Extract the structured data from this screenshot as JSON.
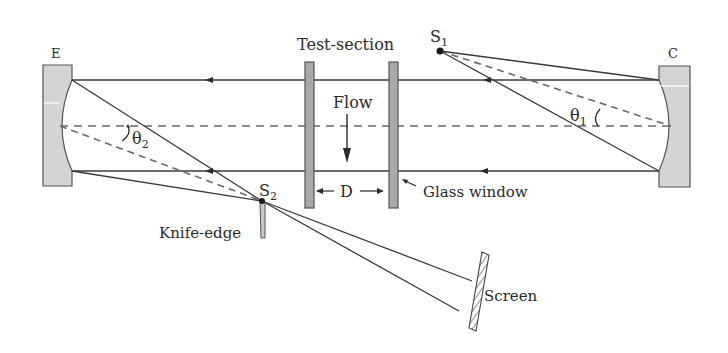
{
  "diagram": {
    "labels": {
      "mirror_e": "E",
      "mirror_c": "C",
      "test_section": "Test-section",
      "source_1": "S",
      "source_1_sub": "1",
      "source_2": "S",
      "source_2_sub": "2",
      "flow": "Flow",
      "distance": "D",
      "glass_window": "Glass window",
      "knife_edge": "Knife-edge",
      "screen": "Screen",
      "theta_1": "θ",
      "theta_1_sub": "1",
      "theta_2": "θ",
      "theta_2_sub": "2"
    },
    "colors": {
      "line": "#3a3a3a",
      "dashed_axis": "#6a6a6a",
      "mirror_fill": "#d4d4d4",
      "window_fill": "#a9a9a9",
      "background": "#ffffff"
    }
  }
}
